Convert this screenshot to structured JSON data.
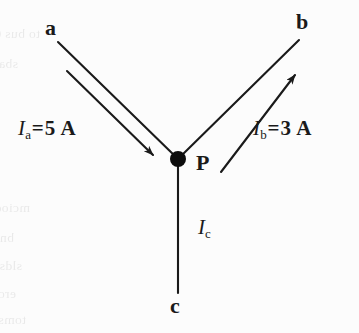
{
  "figure": {
    "type": "circuit-junction-diagram",
    "background_color": "#fcfcfc",
    "ink_color": "#1a1a1a",
    "nodes": {
      "a": "a",
      "b": "b",
      "c": "c",
      "p": "P"
    },
    "labels": {
      "current_a": {
        "symbol": "I",
        "subscript": "a",
        "equals": "=",
        "value": "5",
        "unit": "A",
        "full": "Ia = 5 A"
      },
      "current_b": {
        "symbol": "I",
        "subscript": "b",
        "equals": "=",
        "value": "3",
        "unit": "A",
        "full": "Ib = 3 A"
      },
      "current_c": {
        "symbol": "I",
        "subscript": "c",
        "full": "Ic"
      }
    },
    "geometry": {
      "junction": {
        "x": 178,
        "y": 159,
        "dot_radius": 8
      },
      "branch_a": {
        "from_x": 58,
        "from_y": 42,
        "to_x": 178,
        "to_y": 159
      },
      "branch_b": {
        "from_x": 178,
        "from_y": 159,
        "to_x": 299,
        "to_y": 40
      },
      "branch_c": {
        "from_x": 178,
        "from_y": 159,
        "to_x": 178,
        "to_y": 293
      },
      "arrow_a": {
        "from_x": 67,
        "from_y": 71,
        "to_x": 155,
        "to_y": 157,
        "direction": "toward-junction"
      },
      "arrow_b": {
        "from_x": 221,
        "from_y": 172,
        "to_x": 297,
        "to_y": 72,
        "direction": "away-from-junction"
      }
    },
    "ghost_text_lines": [
      "to bus 01 10 wires tuonelosen of boo 2 ent",
      "sbaltov bns anos tnemus sidthnidth",
      "mcioq ts besilsuoiv ed nso 21 .pi7 ni",
      "bns A 2 = sl ;eniwonos olbbim and bus",
      "sldss lim sit ni anim A 8 = ds on",
      "eroiw eds ni anim Ao aeulsv oil bnit",
      "toms zi eqolz ont nonvo enil brs"
    ]
  }
}
